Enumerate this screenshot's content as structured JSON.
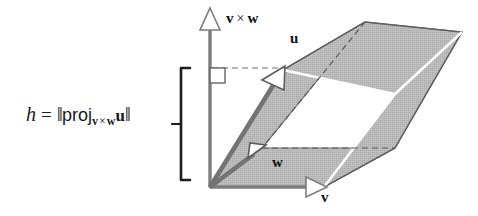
{
  "figure": {
    "background_color": "#ffffff"
  },
  "formula": {
    "variable": "h",
    "equals": "=",
    "open_norm": "‖",
    "proj_operator": "proj",
    "subscript_first": "v",
    "subscript_times": "×",
    "subscript_second": "w",
    "projected_vector": "u",
    "close_norm": "‖",
    "full_text": "h = ‖proj_(v × w) u‖"
  },
  "labels": {
    "cross_product": {
      "first": "v",
      "times": "×",
      "second": "w"
    },
    "vector_u": "u",
    "vector_w": "w",
    "vector_v": "v"
  },
  "colors": {
    "face_fill": "#b6b6b6",
    "face_fill_light": "#c2c2c2",
    "edge_dark": "#555555",
    "edge_white": "#ffffff",
    "axis_gray": "#808080",
    "vector_gray": "#6e6e6e",
    "bracket_black": "#1a1a1a",
    "dashed_gray": "#707070",
    "text_black": "#111111"
  },
  "geometry": {
    "origin": {
      "x": 210,
      "y": 187
    },
    "axis_vxw_tip": {
      "x": 210,
      "y": 12
    },
    "axis_v_tip": {
      "x": 324,
      "y": 187
    },
    "vector_u_tip": {
      "x": 283,
      "y": 70
    },
    "vector_w_tip": {
      "x": 262,
      "y": 148
    },
    "right_angle_marker": {
      "x": 210,
      "y": 68,
      "size": 14
    },
    "height_bracket": {
      "x": 180,
      "top": 68,
      "bottom": 180
    }
  }
}
